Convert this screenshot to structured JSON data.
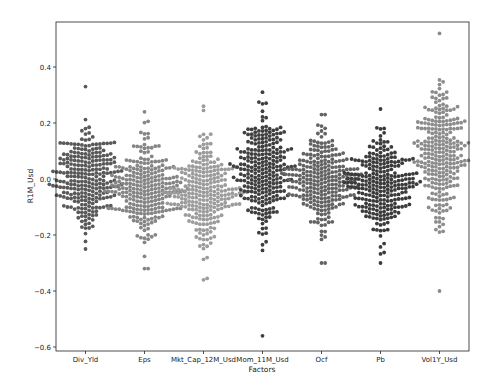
{
  "chart_data": {
    "type": "scatter",
    "subtype": "swarm",
    "title": "",
    "xlabel": "Factors",
    "ylabel": "R1M_Usd",
    "categories": [
      "Div_Yld",
      "Eps",
      "Mkt_Cap_12M_Usd",
      "Mom_11M_Usd",
      "Ocf",
      "Pb",
      "Vol1Y_Usd"
    ],
    "ylim": [
      -0.61,
      0.56
    ],
    "yticks": [
      0.4,
      0.2,
      0.0,
      -0.2,
      -0.4,
      -0.6
    ],
    "ytick_labels": [
      "0.4",
      "0.2",
      "0.0",
      "−0.2",
      "−0.4",
      "−0.6"
    ],
    "grid": false,
    "legend": null,
    "series": [
      {
        "name": "Div_Yld",
        "color": "#595959",
        "n": 260,
        "min": -0.25,
        "max": 0.33,
        "center": 0.0,
        "spread": 0.085
      },
      {
        "name": "Eps",
        "color": "#858585",
        "n": 260,
        "min": -0.32,
        "max": 0.24,
        "center": -0.03,
        "spread": 0.085
      },
      {
        "name": "Mkt_Cap_12M_Usd",
        "color": "#9c9c9c",
        "n": 260,
        "min": -0.36,
        "max": 0.26,
        "center": -0.05,
        "spread": 0.09
      },
      {
        "name": "Mom_11M_Usd",
        "color": "#3f3f3f",
        "n": 260,
        "min": -0.56,
        "max": 0.31,
        "center": 0.03,
        "spread": 0.1
      },
      {
        "name": "Ocf",
        "color": "#636363",
        "n": 260,
        "min": -0.3,
        "max": 0.23,
        "center": -0.01,
        "spread": 0.085
      },
      {
        "name": "Pb",
        "color": "#3b3b3b",
        "n": 260,
        "min": -0.3,
        "max": 0.25,
        "center": -0.02,
        "spread": 0.085
      },
      {
        "name": "Vol1Y_Usd",
        "color": "#8c8c8c",
        "n": 260,
        "min": -0.4,
        "max": 0.52,
        "center": 0.08,
        "spread": 0.12
      }
    ]
  }
}
